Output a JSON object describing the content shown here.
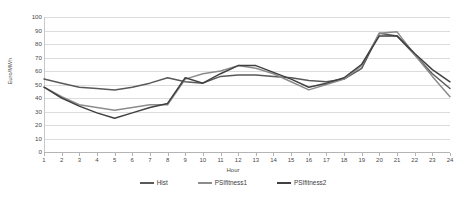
{
  "chart_data": {
    "type": "line",
    "title": "",
    "xlabel": "Hour",
    "ylabel": "Euro/MWh",
    "xlim": [
      1,
      24
    ],
    "ylim": [
      0,
      100
    ],
    "y_ticks": [
      0,
      10,
      20,
      30,
      40,
      50,
      60,
      70,
      80,
      90,
      100
    ],
    "grid": true,
    "legend_position": "bottom",
    "categories": [
      1,
      2,
      3,
      4,
      5,
      6,
      7,
      8,
      9,
      10,
      11,
      12,
      13,
      14,
      15,
      16,
      17,
      18,
      19,
      20,
      21,
      22,
      23,
      24
    ],
    "x_tick_labels": [
      "1",
      "2",
      "3",
      "4",
      "5",
      "6",
      "7",
      "8",
      "9",
      "10",
      "11",
      "12",
      "13",
      "14",
      "15",
      "16",
      "17",
      "18",
      "19",
      "20",
      "21",
      "22",
      "23",
      "24"
    ],
    "series": [
      {
        "name": "Hist",
        "color": "#595959",
        "values": [
          54,
          51,
          48,
          47,
          46,
          48,
          51,
          55,
          52,
          51,
          56,
          57,
          57,
          56,
          55,
          53,
          52,
          54,
          62,
          88,
          86,
          72,
          58,
          47
        ]
      },
      {
        "name": "PSIfitness1",
        "color": "#8c8c8c",
        "values": [
          48,
          41,
          35,
          33,
          31,
          33,
          35,
          35,
          54,
          58,
          60,
          64,
          62,
          58,
          52,
          46,
          50,
          54,
          64,
          88,
          89,
          72,
          56,
          41
        ]
      },
      {
        "name": "PSIfitness2",
        "color": "#404040",
        "values": [
          48,
          40,
          34,
          29,
          25,
          29,
          33,
          36,
          55,
          51,
          58,
          64,
          64,
          59,
          54,
          48,
          51,
          55,
          65,
          86,
          86,
          73,
          61,
          52
        ]
      }
    ]
  },
  "axis": {
    "y_title": "Euro/MWh",
    "x_title": "Hour"
  }
}
